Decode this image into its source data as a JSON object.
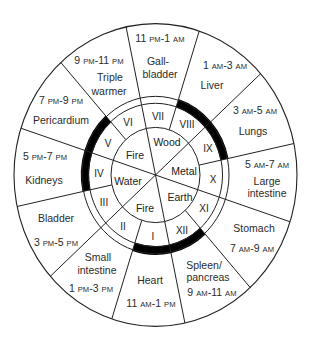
{
  "diagram": {
    "type": "meridian-clock-wheel",
    "center": [
      155.5,
      175
    ],
    "scale_y": 1.07,
    "radii": {
      "outer": 141.5,
      "ring_outer": 73.5,
      "ring_inner": 67,
      "element": 44.5
    },
    "colors": {
      "line": "#222222",
      "text": "#2b2b2b",
      "highlight": "#000000",
      "background": "#ffffff"
    },
    "full_diameter_angles_deg": [
      -12,
      48,
      108
    ],
    "half_line_angles_deg": [
      18,
      78,
      138,
      198,
      258,
      318
    ],
    "thick_arcs_deg": [
      [
        18,
        78
      ],
      [
        138,
        198
      ],
      [
        258,
        318
      ]
    ]
  },
  "organs": [
    {
      "id": "gallbladder",
      "numeral": "VII",
      "lines": [
        "Gall-",
        "bladder"
      ],
      "time": {
        "start": "11",
        "start_ap": "PM",
        "end": "1",
        "end_ap": "AM"
      },
      "time_pos": [
        160,
        38
      ],
      "name_pos": [
        [
          158,
          61
        ],
        [
          160,
          74
        ]
      ],
      "numeral_pos": [
        158,
        117
      ]
    },
    {
      "id": "liver",
      "numeral": "VIII",
      "lines": [
        "Liver"
      ],
      "time": {
        "start": "1",
        "start_ap": "AM",
        "end": "3",
        "end_ap": "AM"
      },
      "time_pos": [
        225,
        65
      ],
      "name_pos": [
        [
          212,
          85
        ]
      ],
      "numeral_pos": [
        187,
        125
      ]
    },
    {
      "id": "lungs",
      "numeral": "IX",
      "lines": [
        "Lungs"
      ],
      "time": {
        "start": "3",
        "start_ap": "AM",
        "end": "5",
        "end_ap": "AM"
      },
      "time_pos": [
        255,
        110
      ],
      "name_pos": [
        [
          253,
          131
        ]
      ],
      "numeral_pos": [
        208,
        149
      ]
    },
    {
      "id": "large-intestine",
      "numeral": "X",
      "lines": [
        "Large",
        "intestine"
      ],
      "time": {
        "start": "5",
        "start_ap": "AM",
        "end": "7",
        "end_ap": "AM"
      },
      "time_pos": [
        267,
        164
      ],
      "name_pos": [
        [
          267,
          181
        ],
        [
          267,
          193
        ]
      ],
      "numeral_pos": [
        213,
        180
      ]
    },
    {
      "id": "stomach",
      "numeral": "XI",
      "lines": [
        "Stomach"
      ],
      "time": {
        "start": "7",
        "start_ap": "AM",
        "end": "9",
        "end_ap": "AM"
      },
      "time_pos": [
        252,
        248
      ],
      "name_pos": [
        [
          254,
          228
        ]
      ],
      "numeral_pos": [
        204,
        209
      ]
    },
    {
      "id": "spleen-pancreas",
      "numeral": "XII",
      "lines": [
        "Spleen/",
        "pancreas"
      ],
      "time": {
        "start": "9",
        "start_ap": "AM",
        "end": "11",
        "end_ap": "AM"
      },
      "time_pos": [
        212,
        292
      ],
      "name_pos": [
        [
          204,
          265
        ],
        [
          208,
          277
        ]
      ],
      "numeral_pos": [
        182,
        231
      ]
    },
    {
      "id": "heart",
      "numeral": "I",
      "lines": [
        "Heart"
      ],
      "time": {
        "start": "11",
        "start_ap": "AM",
        "end": "1",
        "end_ap": "PM"
      },
      "time_pos": [
        151,
        303
      ],
      "name_pos": [
        [
          150,
          280
        ]
      ],
      "numeral_pos": [
        153,
        237
      ]
    },
    {
      "id": "small-intestine",
      "numeral": "II",
      "lines": [
        "Small",
        "intestine"
      ],
      "time": {
        "start": "1",
        "start_ap": "PM",
        "end": "3",
        "end_ap": "PM"
      },
      "time_pos": [
        91,
        288
      ],
      "name_pos": [
        [
          98,
          257
        ],
        [
          97,
          270
        ]
      ],
      "numeral_pos": [
        123,
        227
      ]
    },
    {
      "id": "bladder",
      "numeral": "III",
      "lines": [
        "Bladder"
      ],
      "time": {
        "start": "3",
        "start_ap": "PM",
        "end": "5",
        "end_ap": "PM"
      },
      "time_pos": [
        56,
        242
      ],
      "name_pos": [
        [
          56,
          218
        ]
      ],
      "numeral_pos": [
        104,
        203
      ]
    },
    {
      "id": "kidneys",
      "numeral": "IV",
      "lines": [
        "Kidneys"
      ],
      "time": {
        "start": "5",
        "start_ap": "PM",
        "end": "7",
        "end_ap": "PM"
      },
      "time_pos": [
        45,
        156
      ],
      "name_pos": [
        [
          44,
          180
        ]
      ],
      "numeral_pos": [
        99,
        174
      ]
    },
    {
      "id": "pericardium",
      "numeral": "V",
      "lines": [
        "Pericardium"
      ],
      "time": {
        "start": "7",
        "start_ap": "PM",
        "end": "9",
        "end_ap": "PM"
      },
      "time_pos": [
        61,
        100
      ],
      "name_pos": [
        [
          61,
          120
        ]
      ],
      "numeral_pos": [
        108,
        144
      ]
    },
    {
      "id": "triple-warmer",
      "numeral": "VI",
      "lines": [
        "Triple",
        "warmer"
      ],
      "time": {
        "start": "9",
        "start_ap": "PM",
        "end": "11",
        "end_ap": "PM"
      },
      "time_pos": [
        99,
        60
      ],
      "name_pos": [
        [
          110,
          77
        ],
        [
          109,
          91
        ]
      ],
      "numeral_pos": [
        128,
        123
      ]
    }
  ],
  "elements": [
    {
      "id": "wood",
      "label": "Wood",
      "pos": [
        167,
        142
      ]
    },
    {
      "id": "metal",
      "label": "Metal",
      "pos": [
        184,
        171
      ]
    },
    {
      "id": "earth",
      "label": "Earth",
      "pos": [
        180,
        197
      ]
    },
    {
      "id": "fire-lower",
      "label": "Fire",
      "pos": [
        145,
        208
      ]
    },
    {
      "id": "water",
      "label": "Water",
      "pos": [
        128,
        181
      ]
    },
    {
      "id": "fire-upper",
      "label": "Fire",
      "pos": [
        135,
        155
      ]
    }
  ]
}
